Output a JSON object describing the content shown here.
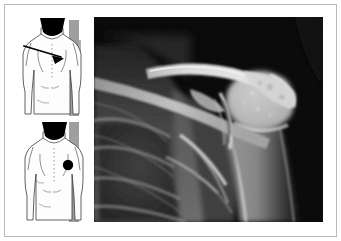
{
  "figure": {
    "kind": "medical-figure",
    "background_color": "#ffffff",
    "frame_color": "#b9b9b9"
  },
  "illustrations": {
    "panel_name": "body-diagram-column",
    "count": 2,
    "view": "posterior torso",
    "items": [
      {
        "id": "upper",
        "name": "body-diagram-upper",
        "annotation_type": "arrow",
        "annotation_name": "pointer-arrow",
        "annotation_target": "shoulder",
        "annotation_color": "#000000",
        "skin_color": "#fdfdfd",
        "outline_color": "#3a3a3a",
        "hair_color": "#000000",
        "band_color": "#8e8e8e"
      },
      {
        "id": "lower",
        "name": "body-diagram-lower",
        "annotation_type": "dot",
        "annotation_name": "site-marker-dot",
        "annotation_target": "shoulder",
        "annotation_color": "#000000",
        "skin_color": "#fdfdfd",
        "outline_color": "#3a3a3a",
        "hair_color": "#000000",
        "band_color": "#8e8e8e"
      }
    ]
  },
  "radiograph": {
    "panel_name": "shoulder-radiograph",
    "modality": "X-ray",
    "region": "shoulder",
    "projection": "anteroposterior",
    "background_color": "#050505",
    "bone_color": "#e3e3e3",
    "soft_tissue_color": "#6e6e6e",
    "structures": [
      "clavicle",
      "acromion",
      "coracoid process",
      "scapular spine",
      "scapular body",
      "glenoid",
      "humeral head",
      "humeral shaft",
      "ribs",
      "lung field"
    ]
  }
}
